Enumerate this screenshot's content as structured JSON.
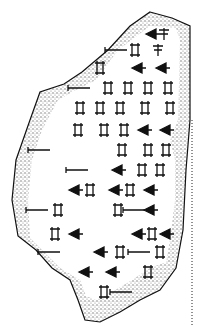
{
  "figure": {
    "colors": {
      "background": "#ffffff",
      "ink": "#111111",
      "stipple": "#8a8a8a"
    },
    "glyph_rows": [
      {
        "y": 34,
        "glyphs": [
          [
            152,
            "wedge"
          ],
          [
            164,
            "sign"
          ]
        ]
      },
      {
        "y": 50,
        "glyphs": [
          [
            117,
            "line"
          ],
          [
            135,
            "box"
          ],
          [
            158,
            "sign"
          ]
        ]
      },
      {
        "y": 68,
        "glyphs": [
          [
            100,
            "box"
          ],
          [
            138,
            "wedge"
          ],
          [
            162,
            "wedge"
          ]
        ]
      },
      {
        "y": 88,
        "glyphs": [
          [
            80,
            "line"
          ],
          [
            108,
            "box"
          ],
          [
            128,
            "box"
          ],
          [
            148,
            "box"
          ],
          [
            168,
            "box"
          ]
        ]
      },
      {
        "y": 108,
        "glyphs": [
          [
            80,
            "box"
          ],
          [
            100,
            "box"
          ],
          [
            120,
            "box"
          ],
          [
            145,
            "box"
          ],
          [
            170,
            "box"
          ]
        ]
      },
      {
        "y": 130,
        "glyphs": [
          [
            78,
            "box"
          ],
          [
            104,
            "box"
          ],
          [
            124,
            "box"
          ],
          [
            144,
            "wedge"
          ],
          [
            166,
            "wedge"
          ]
        ]
      },
      {
        "y": 150,
        "glyphs": [
          [
            40,
            "line"
          ],
          [
            122,
            "box"
          ],
          [
            148,
            "box"
          ],
          [
            166,
            "box"
          ]
        ]
      },
      {
        "y": 170,
        "glyphs": [
          [
            78,
            "line"
          ],
          [
            118,
            "wedge"
          ],
          [
            142,
            "box"
          ],
          [
            160,
            "box"
          ]
        ]
      },
      {
        "y": 190,
        "glyphs": [
          [
            75,
            "wedge"
          ],
          [
            90,
            "box"
          ],
          [
            115,
            "wedge"
          ],
          [
            130,
            "box"
          ],
          [
            150,
            "wedge"
          ]
        ]
      },
      {
        "y": 210,
        "glyphs": [
          [
            38,
            "line"
          ],
          [
            58,
            "box"
          ],
          [
            118,
            "box"
          ],
          [
            135,
            "line"
          ],
          [
            150,
            "wedge"
          ]
        ]
      },
      {
        "y": 234,
        "glyphs": [
          [
            55,
            "box"
          ],
          [
            75,
            "wedge"
          ],
          [
            138,
            "wedge"
          ],
          [
            152,
            "box"
          ],
          [
            166,
            "wedge"
          ]
        ]
      },
      {
        "y": 252,
        "glyphs": [
          [
            50,
            "line"
          ],
          [
            100,
            "wedge"
          ],
          [
            120,
            "box"
          ],
          [
            140,
            "line"
          ],
          [
            160,
            "box"
          ]
        ]
      },
      {
        "y": 272,
        "glyphs": [
          [
            85,
            "wedge"
          ],
          [
            112,
            "wedge"
          ],
          [
            148,
            "box"
          ]
        ]
      },
      {
        "y": 292,
        "glyphs": [
          [
            104,
            "box"
          ],
          [
            122,
            "line"
          ]
        ]
      }
    ]
  }
}
